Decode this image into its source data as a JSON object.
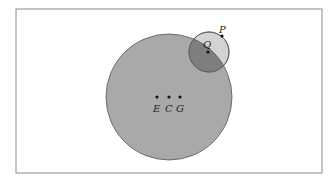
{
  "diagram": {
    "frame": {
      "x": 16,
      "y": 9,
      "w": 306,
      "h": 164,
      "stroke": "#8a8a8a"
    },
    "big_circle": {
      "cx": 169,
      "cy": 97,
      "r": 63,
      "fill": "#a9a9a9",
      "stroke": "#555555"
    },
    "small_circle": {
      "cx": 209,
      "cy": 52,
      "r": 20,
      "fill": "#d3d3d3",
      "stroke": "#555555"
    },
    "overlap_fill": "#7e7e7e",
    "points": [
      {
        "id": "P",
        "label": "P",
        "x": 222,
        "y": 36
      },
      {
        "id": "Q",
        "label": "Q",
        "x": 208,
        "y": 52
      },
      {
        "id": "E",
        "label": "E",
        "x": 157,
        "y": 97
      },
      {
        "id": "C",
        "label": "C",
        "x": 169,
        "y": 97
      },
      {
        "id": "G",
        "label": "G",
        "x": 180,
        "y": 97
      }
    ]
  },
  "labels": {
    "P": "P",
    "Q": "Q",
    "E": "E",
    "C": "C",
    "G": "G"
  }
}
